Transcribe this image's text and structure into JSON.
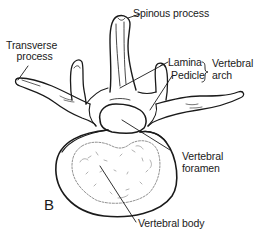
{
  "figure": {
    "panel_letter": "B"
  },
  "labels": {
    "spinous_process": "Spinous process",
    "transverse_process_line1": "Transverse",
    "transverse_process_line2": "process",
    "lamina": "Lamina",
    "pedicle": "Pedicle",
    "vertebral_arch_line1": "Vertebral",
    "vertebral_arch_line2": "arch",
    "vertebral_foramen_line1": "Vertebral",
    "vertebral_foramen_line2": "foramen",
    "vertebral_body": "Vertebral body"
  },
  "colors": {
    "ink": "#1a1a1a",
    "background": "#ffffff"
  }
}
